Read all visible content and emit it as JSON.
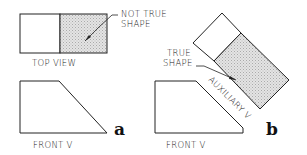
{
  "figure_a": {
    "letter": "a",
    "top_view_label": "TOP VIEW",
    "front_view_label": "FRONT V",
    "callout_line1": "NOT TRUE",
    "callout_line2": "SHAPE"
  },
  "figure_b": {
    "letter": "b",
    "front_view_label": "FRONT V",
    "aux_view_label": "AUXILIARY V",
    "callout_line1": "TRUE",
    "callout_line2": "SHAPE"
  },
  "colors": {
    "line": "#222222",
    "shade": "#cfcfcf"
  }
}
